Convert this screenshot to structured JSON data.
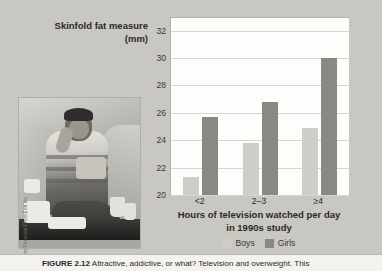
{
  "figure": {
    "photo_credit": "© Tony Freeman/PhotoEdit Inc.",
    "photo_alt": "boy-eating-snacks-on-couch-photo",
    "caption_prefix": "FIGURE 2.12",
    "caption_text": "Attractive, addictive, or what? Television and overweight. This"
  },
  "chart_data": {
    "type": "bar",
    "title": "",
    "ylabel": "Skinfold fat measure (mm)",
    "xlabel": "Hours of television watched per day in 1990s study",
    "xlabel_line1": "Hours of television watched per day",
    "xlabel_line2": "in 1990s study",
    "categories": [
      "<2",
      "2–3",
      "≥4"
    ],
    "series": [
      {
        "name": "Boys",
        "color": "#cfcdc8",
        "values": [
          21.3,
          23.8,
          24.9
        ]
      },
      {
        "name": "Girls",
        "color": "#8a8884",
        "values": [
          25.7,
          26.8,
          30.0
        ]
      }
    ],
    "ylim": [
      20,
      33
    ],
    "yticks": [
      20,
      22,
      24,
      26,
      28,
      30,
      32
    ],
    "grid": true,
    "legend_position": "bottom"
  }
}
